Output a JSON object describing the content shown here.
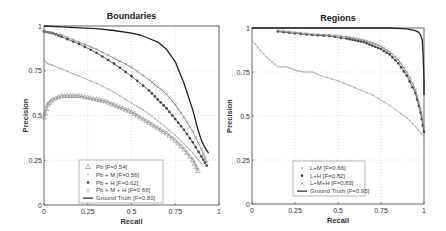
{
  "chart_data": [
    {
      "type": "line",
      "title": "Boundaries",
      "xlabel": "Recall",
      "ylabel": "Precision",
      "xlim": [
        0,
        1
      ],
      "ylim": [
        0,
        1
      ],
      "xticks": [
        "0",
        "0.25",
        "0.5",
        "0.75",
        "1"
      ],
      "yticks": [
        "0",
        "0.25",
        "0.5",
        "0.75",
        "1"
      ],
      "grid": true,
      "legend_position": "lower-center",
      "series": [
        {
          "name": "Pb [F=0.54]",
          "marker": "triangle",
          "color": "#888888",
          "x": [
            0.0,
            0.02,
            0.05,
            0.1,
            0.15,
            0.2,
            0.25,
            0.3,
            0.35,
            0.4,
            0.45,
            0.5,
            0.55,
            0.6,
            0.65,
            0.7,
            0.75,
            0.8,
            0.85,
            0.88
          ],
          "y": [
            0.49,
            0.56,
            0.59,
            0.61,
            0.61,
            0.61,
            0.6,
            0.59,
            0.58,
            0.56,
            0.54,
            0.52,
            0.49,
            0.46,
            0.43,
            0.4,
            0.36,
            0.31,
            0.25,
            0.19
          ]
        },
        {
          "name": "Pb + M [F=0.56]",
          "marker": "dot",
          "color": "#aaaaaa",
          "x": [
            0.0,
            0.02,
            0.05,
            0.1,
            0.2,
            0.3,
            0.4,
            0.5,
            0.55,
            0.6,
            0.65,
            0.7,
            0.75,
            0.8,
            0.85,
            0.9
          ],
          "y": [
            0.81,
            0.79,
            0.78,
            0.76,
            0.72,
            0.68,
            0.63,
            0.57,
            0.54,
            0.51,
            0.47,
            0.43,
            0.39,
            0.34,
            0.29,
            0.23
          ]
        },
        {
          "name": "Pb + H [F=0.62]",
          "marker": "asterisk",
          "color": "#444444",
          "x": [
            0.0,
            0.05,
            0.1,
            0.2,
            0.3,
            0.4,
            0.5,
            0.6,
            0.65,
            0.7,
            0.75,
            0.8,
            0.85,
            0.9,
            0.93
          ],
          "y": [
            0.97,
            0.96,
            0.94,
            0.9,
            0.85,
            0.79,
            0.72,
            0.64,
            0.59,
            0.54,
            0.48,
            0.42,
            0.35,
            0.27,
            0.22
          ]
        },
        {
          "name": "Pb + M + H [F=0.66]",
          "marker": "x",
          "color": "#888888",
          "x": [
            0.0,
            0.05,
            0.1,
            0.2,
            0.3,
            0.4,
            0.5,
            0.6,
            0.65,
            0.7,
            0.75,
            0.8,
            0.85,
            0.9,
            0.93
          ],
          "y": [
            0.97,
            0.96,
            0.95,
            0.91,
            0.87,
            0.82,
            0.77,
            0.7,
            0.66,
            0.62,
            0.56,
            0.49,
            0.41,
            0.31,
            0.24
          ]
        },
        {
          "name": "Ground Truth [F=0.80]",
          "marker": "none",
          "color": "#222222",
          "x": [
            0.0,
            0.1,
            0.2,
            0.3,
            0.4,
            0.5,
            0.55,
            0.6,
            0.65,
            0.7,
            0.75,
            0.8,
            0.85,
            0.88,
            0.9,
            0.92,
            0.94
          ],
          "y": [
            1.0,
            0.995,
            0.99,
            0.985,
            0.975,
            0.96,
            0.95,
            0.93,
            0.91,
            0.87,
            0.8,
            0.68,
            0.53,
            0.42,
            0.36,
            0.32,
            0.29
          ]
        }
      ]
    },
    {
      "type": "line",
      "title": "Regions",
      "xlabel": "Recall",
      "ylabel": "Precision",
      "xlim": [
        0,
        1
      ],
      "ylim": [
        0,
        1
      ],
      "xticks": [
        "0",
        "0.25",
        "0.5",
        "0.75",
        "1"
      ],
      "yticks": [
        "0",
        "0.25",
        "0.5",
        "0.75",
        "1"
      ],
      "grid": true,
      "legend_position": "lower-center",
      "series": [
        {
          "name": "L+M [F=0.66]",
          "marker": "dot",
          "color": "#aaaaaa",
          "x": [
            0.0,
            0.05,
            0.1,
            0.15,
            0.2,
            0.25,
            0.3,
            0.35,
            0.4,
            0.5,
            0.6,
            0.7,
            0.8,
            0.9,
            0.95,
            1.0
          ],
          "y": [
            0.93,
            0.87,
            0.82,
            0.78,
            0.78,
            0.76,
            0.75,
            0.75,
            0.73,
            0.7,
            0.66,
            0.62,
            0.56,
            0.49,
            0.44,
            0.38
          ]
        },
        {
          "name": "L+H [F=0.82]",
          "marker": "asterisk",
          "color": "#444444",
          "x": [
            0.15,
            0.25,
            0.35,
            0.45,
            0.55,
            0.6,
            0.65,
            0.7,
            0.75,
            0.8,
            0.85,
            0.9,
            0.95,
            0.98,
            1.0
          ],
          "y": [
            0.98,
            0.97,
            0.96,
            0.955,
            0.94,
            0.93,
            0.92,
            0.9,
            0.88,
            0.85,
            0.8,
            0.73,
            0.63,
            0.52,
            0.41
          ]
        },
        {
          "name": "L+M+H [F=0.83]",
          "marker": "x",
          "color": "#888888",
          "x": [
            0.15,
            0.25,
            0.35,
            0.45,
            0.55,
            0.6,
            0.65,
            0.7,
            0.75,
            0.8,
            0.85,
            0.9,
            0.95,
            0.98,
            1.0
          ],
          "y": [
            0.985,
            0.975,
            0.965,
            0.96,
            0.95,
            0.94,
            0.93,
            0.915,
            0.895,
            0.865,
            0.82,
            0.75,
            0.65,
            0.54,
            0.43
          ]
        },
        {
          "name": "Ground Truth [F=0.95]",
          "marker": "none",
          "color": "#222222",
          "x": [
            0.0,
            0.2,
            0.4,
            0.6,
            0.8,
            0.9,
            0.95,
            0.97,
            0.98,
            0.99,
            0.995,
            1.0,
            1.0
          ],
          "y": [
            1.0,
            1.0,
            1.0,
            1.0,
            1.0,
            0.995,
            0.985,
            0.975,
            0.96,
            0.93,
            0.85,
            0.7,
            0.62
          ]
        }
      ]
    }
  ],
  "legend_left": [
    "Pb [F=0.54]",
    "Pb + M [F=0.56]",
    "Pb + H [F=0.62]",
    "Pb + M + H [F=0.66]",
    "Ground Truth [F=0.80]"
  ],
  "legend_right": [
    "L+M [F=0.66]",
    "L+H [F=0.82]",
    "L+M+H [F=0.83]",
    "Ground Truth [F=0.95]"
  ]
}
